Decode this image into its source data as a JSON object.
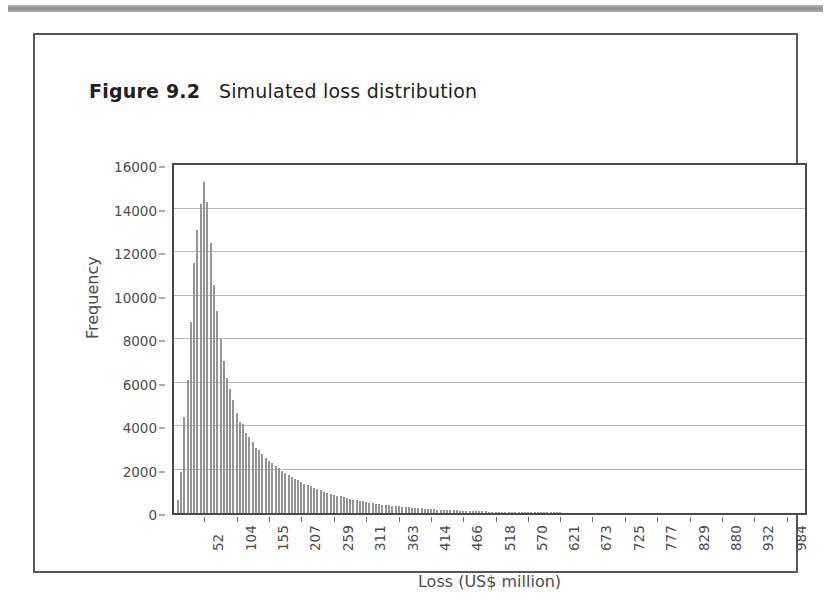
{
  "figure": {
    "caption_label": "Figure 9.2",
    "caption_text": "Simulated loss distribution"
  },
  "chart_data": {
    "type": "bar",
    "title": "Simulated loss distribution",
    "xlabel": "Loss (US$ million)",
    "ylabel": "Frequency",
    "ylim": [
      0,
      16000
    ],
    "xlim": [
      0,
      1010
    ],
    "grid": true,
    "legend": false,
    "y_ticks": [
      0,
      2000,
      4000,
      6000,
      8000,
      10000,
      12000,
      14000,
      16000
    ],
    "y_tick_labels": [
      "0",
      "2000",
      "4000",
      "6000",
      "8000",
      "10000",
      "12000",
      "14000",
      "16000"
    ],
    "x_ticks": [
      52,
      104,
      155,
      207,
      259,
      311,
      363,
      414,
      466,
      518,
      570,
      621,
      673,
      725,
      777,
      829,
      880,
      932,
      984
    ],
    "x_tick_labels": [
      "52",
      "104",
      "155",
      "207",
      "259",
      "311",
      "363",
      "414",
      "466",
      "518",
      "570",
      "621",
      "673",
      "725",
      "777",
      "829",
      "880",
      "932",
      "984"
    ],
    "bar_color": "#949496",
    "series": [
      {
        "name": "Simulated loss frequency",
        "bin_centers": [
          5,
          10,
          15,
          21,
          26,
          31,
          36,
          41,
          47,
          52,
          57,
          62,
          67,
          73,
          78,
          83,
          88,
          93,
          99,
          104,
          109,
          114,
          119,
          125,
          130,
          135,
          140,
          145,
          151,
          155,
          161,
          166,
          171,
          176,
          182,
          187,
          192,
          197,
          202,
          207,
          213,
          218,
          223,
          228,
          233,
          239,
          244,
          249,
          254,
          259,
          265,
          270,
          275,
          280,
          285,
          291,
          296,
          301,
          306,
          311,
          317,
          322,
          327,
          332,
          337,
          343,
          348,
          353,
          358,
          363,
          369,
          374,
          379,
          384,
          389,
          395,
          400,
          405,
          410,
          414,
          420,
          425,
          430,
          435,
          440,
          446,
          451,
          456,
          461,
          466,
          472,
          477,
          482,
          487,
          492,
          498,
          503,
          508,
          513,
          518,
          524,
          529,
          534,
          539,
          544,
          550,
          555,
          560,
          565,
          570,
          576,
          581,
          586,
          591,
          596,
          602,
          607,
          612,
          617,
          621
        ],
        "values": [
          600,
          1900,
          4400,
          6100,
          8800,
          11500,
          13000,
          14200,
          15200,
          14300,
          12400,
          10500,
          9300,
          8000,
          7000,
          6200,
          5700,
          5200,
          4600,
          4200,
          4100,
          3700,
          3500,
          3250,
          3000,
          2900,
          2700,
          2550,
          2400,
          2300,
          2150,
          2050,
          1950,
          1850,
          1750,
          1650,
          1550,
          1500,
          1420,
          1350,
          1280,
          1220,
          1150,
          1100,
          1040,
          980,
          930,
          880,
          840,
          800,
          760,
          720,
          690,
          650,
          620,
          590,
          560,
          530,
          500,
          480,
          455,
          430,
          410,
          390,
          370,
          350,
          330,
          315,
          300,
          285,
          270,
          255,
          245,
          230,
          220,
          210,
          198,
          188,
          178,
          170,
          160,
          152,
          145,
          138,
          130,
          124,
          118,
          112,
          106,
          100,
          95,
          90,
          85,
          81,
          77,
          73,
          69,
          65,
          62,
          58,
          55,
          52,
          49,
          46,
          44,
          41,
          39,
          37,
          35,
          33,
          31,
          29,
          27,
          26,
          24,
          23,
          21,
          20,
          19
        ]
      }
    ]
  }
}
